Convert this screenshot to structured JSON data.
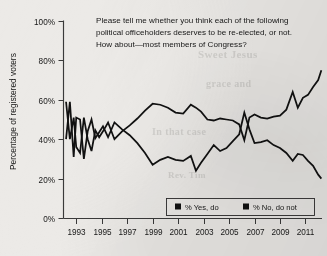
{
  "chart_data": {
    "type": "line",
    "title": "Please tell me whether you think each of the following political officeholders deserves to be re-elected, or not. How about—most members of Congress?",
    "title_lines": [
      "Please tell me whether you think each of the following",
      "political officeholders deserves to be re-elected, or not.",
      "How about—most members of Congress?"
    ],
    "xlabel": "",
    "ylabel": "Percentage of registered voters",
    "ylim": [
      0,
      100
    ],
    "xlim": [
      1992.0,
      2012.3
    ],
    "grid": false,
    "legend_position": "bottom-right",
    "ytick_labels": [
      "0%",
      "20%",
      "40%",
      "60%",
      "80%",
      "100%"
    ],
    "ytick_values": [
      0,
      20,
      40,
      60,
      80,
      100
    ],
    "xtick_labels": [
      "1993",
      "1995",
      "1997",
      "1999",
      "2001",
      "2003",
      "2005",
      "2007",
      "2009",
      "2011"
    ],
    "xtick_values": [
      1993,
      1995,
      1997,
      1999,
      2001,
      2003,
      2005,
      2007,
      2009,
      2011
    ],
    "series": [
      {
        "name": "% Yes, do",
        "color": "#111111",
        "x": [
          1992.2,
          1992.5,
          1992.8,
          1993.0,
          1993.3,
          1993.6,
          1993.9,
          1994.2,
          1994.5,
          1994.8,
          1995.1,
          1995.5,
          1996.0,
          1996.6,
          1997.2,
          1997.8,
          1998.4,
          1999.0,
          1999.6,
          2000.2,
          2000.8,
          2001.4,
          2002.0,
          2002.4,
          2002.8,
          2003.3,
          2003.8,
          2004.3,
          2004.8,
          2005.3,
          2005.8,
          2006.2,
          2006.6,
          2007.0,
          2007.5,
          2008.0,
          2008.5,
          2009.0,
          2009.5,
          2010.0,
          2010.4,
          2010.8,
          2011.2,
          2011.6,
          2012.0,
          2012.25
        ],
        "y": [
          40.0,
          59.0,
          31.0,
          51.0,
          50.0,
          30.0,
          44.0,
          50.0,
          40.5,
          43.5,
          46.5,
          41.0,
          48.5,
          45.0,
          42.0,
          38.0,
          33.0,
          27.0,
          29.5,
          31.0,
          29.5,
          29.0,
          31.5,
          24.0,
          28.0,
          32.5,
          37.0,
          34.0,
          35.5,
          39.0,
          42.5,
          53.5,
          45.0,
          38.0,
          38.5,
          39.5,
          37.0,
          35.5,
          33.0,
          29.0,
          32.5,
          32.0,
          29.0,
          26.5,
          22.0,
          20.0
        ]
      },
      {
        "name": "% No, do not",
        "color": "#111111",
        "x": [
          1992.2,
          1992.5,
          1992.8,
          1993.0,
          1993.3,
          1993.6,
          1993.9,
          1994.2,
          1994.5,
          1994.8,
          1995.1,
          1995.5,
          1996.0,
          1996.6,
          1997.2,
          1997.8,
          1998.4,
          1999.0,
          1999.6,
          2000.2,
          2000.8,
          2001.4,
          2002.0,
          2002.4,
          2002.8,
          2003.3,
          2003.8,
          2004.3,
          2004.8,
          2005.3,
          2005.8,
          2006.2,
          2006.6,
          2007.0,
          2007.5,
          2008.0,
          2008.5,
          2009.0,
          2009.5,
          2010.0,
          2010.4,
          2010.8,
          2011.2,
          2011.6,
          2012.0,
          2012.25
        ],
        "y": [
          59.0,
          40.0,
          51.0,
          36.0,
          33.0,
          51.0,
          40.0,
          34.0,
          44.5,
          41.0,
          44.0,
          48.5,
          40.0,
          44.0,
          47.0,
          50.5,
          54.5,
          58.0,
          57.5,
          56.0,
          53.5,
          53.0,
          57.5,
          56.0,
          54.0,
          50.0,
          49.5,
          50.5,
          50.0,
          49.5,
          47.5,
          39.5,
          51.0,
          52.5,
          51.0,
          50.5,
          51.5,
          52.0,
          55.0,
          64.0,
          56.0,
          61.0,
          62.5,
          66.5,
          70.0,
          75.0
        ]
      }
    ],
    "legend_entries": [
      {
        "label": "% Yes, do",
        "marker": "square",
        "color": "#111111"
      },
      {
        "label": "% No, do not",
        "marker": "square",
        "color": "#111111"
      }
    ]
  },
  "background": {
    "paper_color": "#eceae7",
    "ink_color": "#111111",
    "bleed_through_lines": [
      "Sweet Jesus",
      "grace and",
      "In that case",
      "Rev. Tim"
    ]
  }
}
